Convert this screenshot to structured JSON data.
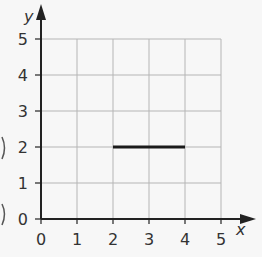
{
  "chart_data": {
    "type": "line",
    "title": "",
    "xlabel": "x",
    "ylabel": "y",
    "xlim": [
      0,
      5
    ],
    "ylim": [
      0,
      5
    ],
    "grid": true,
    "x_ticks": [
      "0",
      "1",
      "2",
      "3",
      "4",
      "5"
    ],
    "y_ticks": [
      "0",
      "1",
      "2",
      "3",
      "4",
      "5"
    ],
    "series": [
      {
        "name": "segment",
        "x": [
          2,
          4
        ],
        "y": [
          2,
          2
        ],
        "color": "#1a1a1a"
      }
    ]
  },
  "colors": {
    "grid": "#b5b5b5",
    "axis": "#222222",
    "segment": "#1a1a1a",
    "background": "#f7f7f7"
  }
}
